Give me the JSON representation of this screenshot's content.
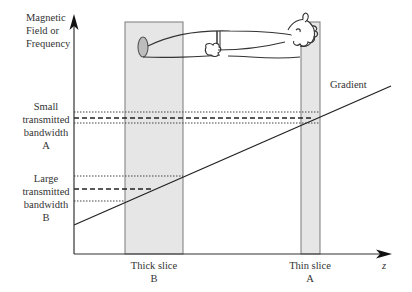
{
  "diagram": {
    "y_axis_label": [
      "Magnetic",
      "Field or",
      "Frequency"
    ],
    "x_axis_label": "z",
    "gradient_label": "Gradient",
    "small_bandwidth_label": [
      "Small",
      "transmitted",
      "bandwidth",
      "A"
    ],
    "large_bandwidth_label": [
      "Large",
      "transmitted",
      "bandwidth",
      "B"
    ],
    "thick_slice_label": [
      "Thick slice",
      "B"
    ],
    "thin_slice_label": [
      "Thin slice",
      "A"
    ],
    "colors": {
      "axis": "#333333",
      "slab_fill": "#e6e6e6",
      "slab_edge": "#777777",
      "text": "#333333",
      "figure_fill": "#bdbdbd"
    }
  }
}
